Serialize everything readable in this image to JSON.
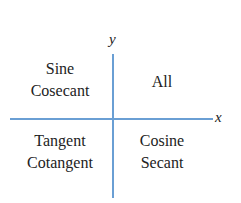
{
  "diagram": {
    "type": "quadrant-diagram",
    "axes": {
      "x_label": "x",
      "y_label": "y",
      "color": "#6a9fd4"
    },
    "quadrants": {
      "q1": {
        "position": "top-right",
        "lines": [
          "All"
        ]
      },
      "q2": {
        "position": "top-left",
        "lines": [
          "Sine",
          "Cosecant"
        ]
      },
      "q3": {
        "position": "bottom-left",
        "lines": [
          "Tangent",
          "Cotangent"
        ]
      },
      "q4": {
        "position": "bottom-right",
        "lines": [
          "Cosine",
          "Secant"
        ]
      }
    },
    "text_color": "#222222"
  }
}
